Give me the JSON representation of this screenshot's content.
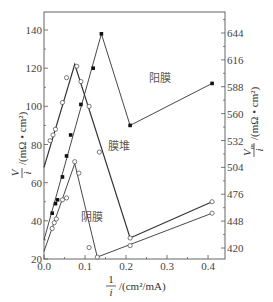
{
  "chart_data": {
    "type": "line",
    "title": "",
    "xlabel": "1/i /(cm²/mA)",
    "xlabel_parts": {
      "num": "1",
      "den": "i",
      "unit": "/(cm²/mA)"
    },
    "ylabel": "V/i /(mΩ·cm²)",
    "ylabel_parts": {
      "num": "V",
      "den": "i",
      "unit": "/(mΩ • cm²)"
    },
    "y2label": "Vm/i /(mΩ·cm²)",
    "y2label_parts": {
      "num": "V",
      "sub": "m",
      "den": "i",
      "unit": "/(mΩ • cm²)"
    },
    "xlim": [
      0.0,
      0.44
    ],
    "ylim": [
      20,
      150
    ],
    "y2lim": [
      392,
      672
    ],
    "xticks": [
      "0.0",
      "0.1",
      "0.2",
      "0.3",
      "0.4"
    ],
    "xtick_values": [
      0.0,
      0.1,
      0.2,
      0.3,
      0.4
    ],
    "yticks": [
      "20",
      "40",
      "60",
      "80",
      "100",
      "120",
      "140"
    ],
    "ytick_values": [
      20,
      40,
      60,
      80,
      100,
      120,
      140
    ],
    "y2ticks": [
      "420",
      "448",
      "476",
      "504",
      "532",
      "560",
      "588",
      "616",
      "644"
    ],
    "y2tick_values": [
      420,
      448,
      476,
      504,
      532,
      560,
      588,
      616,
      644
    ],
    "grid": false,
    "legend_position": "inline labels",
    "series": [
      {
        "name": "膜堆",
        "marker": "open-circle",
        "axis": "left",
        "line": [
          [
            0.0,
            68
          ],
          [
            0.075,
            122
          ],
          [
            0.21,
            31
          ],
          [
            0.41,
            50
          ]
        ],
        "points": [
          [
            0.015,
            82
          ],
          [
            0.022,
            85
          ],
          [
            0.028,
            88
          ],
          [
            0.045,
            102
          ],
          [
            0.055,
            115
          ],
          [
            0.08,
            121
          ],
          [
            0.09,
            113
          ],
          [
            0.11,
            100
          ],
          [
            0.135,
            76
          ],
          [
            0.21,
            31
          ],
          [
            0.41,
            50
          ]
        ]
      },
      {
        "name": "阳膜",
        "marker": "filled-square",
        "axis": "left",
        "line": [
          [
            0.0,
            30
          ],
          [
            0.14,
            138
          ],
          [
            0.21,
            90
          ],
          [
            0.41,
            112
          ]
        ],
        "points": [
          [
            0.02,
            44
          ],
          [
            0.028,
            49
          ],
          [
            0.033,
            51
          ],
          [
            0.045,
            63
          ],
          [
            0.055,
            74
          ],
          [
            0.065,
            85
          ],
          [
            0.09,
            101
          ],
          [
            0.12,
            120
          ],
          [
            0.14,
            138
          ],
          [
            0.21,
            90
          ],
          [
            0.41,
            112
          ]
        ]
      },
      {
        "name": "阴膜",
        "marker": "open-circle",
        "axis": "left",
        "line": [
          [
            0.0,
            24
          ],
          [
            0.075,
            70
          ],
          [
            0.13,
            21
          ],
          [
            0.41,
            44
          ]
        ],
        "points": [
          [
            0.02,
            36
          ],
          [
            0.025,
            39
          ],
          [
            0.03,
            41
          ],
          [
            0.045,
            51
          ],
          [
            0.055,
            52
          ],
          [
            0.075,
            71
          ],
          [
            0.085,
            65
          ],
          [
            0.11,
            26
          ],
          [
            0.13,
            21
          ],
          [
            0.21,
            27
          ],
          [
            0.41,
            44
          ]
        ]
      }
    ],
    "annotations": [
      {
        "text": "阳膜",
        "x": 0.255,
        "y": 113
      },
      {
        "text": "膜堆",
        "x": 0.155,
        "y": 77
      },
      {
        "text": "阴膜",
        "x": 0.09,
        "y": 40
      }
    ]
  },
  "colors": {
    "axis": "#555555",
    "line": "#333333",
    "text": "#444444"
  }
}
